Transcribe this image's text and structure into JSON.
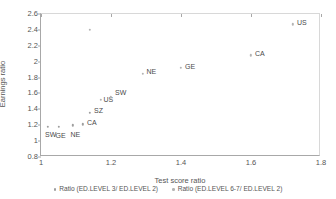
{
  "chart_data": {
    "type": "scatter",
    "title": "",
    "xlabel": "Test score ratio",
    "ylabel": "Earnings ratio",
    "xlim": [
      1,
      1.8
    ],
    "ylim": [
      0.8,
      2.6
    ],
    "xticks": [
      "1",
      "1.2",
      "1.4",
      "1.6",
      "1.8"
    ],
    "xtick_values": [
      1,
      1.2,
      1.4,
      1.6,
      1.8
    ],
    "yticks": [
      "0.8",
      "1",
      "1.2",
      "1.4",
      "1.6",
      "1.8",
      "2",
      "2.2",
      "2.4",
      "2.6"
    ],
    "ytick_values": [
      0.8,
      1,
      1.2,
      1.4,
      1.6,
      1.8,
      2,
      2.2,
      2.4,
      2.6
    ],
    "grid": false,
    "legend_position": "bottom",
    "marker_color": "#9a9a9a",
    "series": [
      {
        "name": "Ratio (ED.LEVEL 3/ ED.LEVEL 2)",
        "color": "#9e9e9e",
        "points": [
          {
            "label": "SW",
            "x": 1.02,
            "y": 1.18,
            "label_dx": -3,
            "label_dy": 8
          },
          {
            "label": "GE",
            "x": 1.05,
            "y": 1.18,
            "label_dx": -3,
            "label_dy": 9
          },
          {
            "label": "NE",
            "x": 1.09,
            "y": 1.2,
            "label_dx": -2,
            "label_dy": 9
          },
          {
            "label": "CA",
            "x": 1.12,
            "y": 1.21,
            "label_dx": 4,
            "label_dy": -2
          },
          {
            "label": "SZ",
            "x": 1.14,
            "y": 1.36,
            "label_dx": 4,
            "label_dy": -2
          }
        ]
      },
      {
        "name": "Ratio (ED.LEVEL 6-7/ ED.LEVEL 2)",
        "color": "#b4b4b4",
        "points": [
          {
            "label": "",
            "x": 1.14,
            "y": 2.4,
            "label_dx": 0,
            "label_dy": 0
          },
          {
            "label": "US",
            "x": 1.17,
            "y": 1.52,
            "label_dx": 3,
            "label_dy": 0
          },
          {
            "label": "SW",
            "x": 1.2,
            "y": 1.55,
            "label_dx": 4,
            "label_dy": -5
          },
          {
            "label": "NE",
            "x": 1.29,
            "y": 1.85,
            "label_dx": 4,
            "label_dy": -2
          },
          {
            "label": "GE",
            "x": 1.4,
            "y": 1.92,
            "label_dx": 4,
            "label_dy": -2
          },
          {
            "label": "CA",
            "x": 1.6,
            "y": 2.08,
            "label_dx": 4,
            "label_dy": -2
          },
          {
            "label": "US",
            "x": 1.72,
            "y": 2.47,
            "label_dx": 4,
            "label_dy": -2
          }
        ]
      }
    ]
  },
  "legend": {
    "items": [
      {
        "label": "Ratio (ED.LEVEL 3/ ED.LEVEL 2)"
      },
      {
        "label": "Ratio (ED.LEVEL 6-7/ ED.LEVEL 2)"
      }
    ]
  }
}
